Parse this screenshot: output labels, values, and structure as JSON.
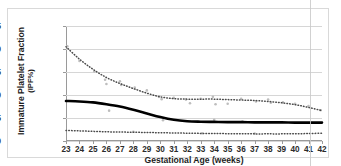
{
  "chart_data": {
    "type": "line",
    "title": "",
    "xlabel": "Gestational Age (weeks)",
    "ylabel": "Immature Platelet Fraction (IPF%)",
    "ylabel_line1": "Immature Platelet Fraction",
    "ylabel_line2": "(IPF%)",
    "xlim": [
      23,
      42
    ],
    "ylim": [
      0,
      25
    ],
    "yticks": [
      0,
      5,
      10,
      15,
      20,
      25
    ],
    "xticks": [
      23,
      24,
      25,
      26,
      27,
      28,
      29,
      30,
      31,
      32,
      33,
      34,
      35,
      36,
      37,
      38,
      39,
      40,
      41,
      42
    ],
    "grid": "horizontal",
    "legend": "none",
    "x": [
      23,
      24,
      25,
      26,
      27,
      28,
      29,
      30,
      31,
      32,
      33,
      34,
      35,
      36,
      37,
      38,
      39,
      40,
      41,
      42
    ],
    "series": [
      {
        "name": "95th percentile",
        "style": "dotted",
        "color": "#4a4a4a",
        "values": [
          20.5,
          17.8,
          15.6,
          13.8,
          12.5,
          11.4,
          10.4,
          9.6,
          9.2,
          9.1,
          9.1,
          9.1,
          9.0,
          8.9,
          8.8,
          8.6,
          8.3,
          7.9,
          7.3,
          6.6
        ]
      },
      {
        "name": "Median",
        "style": "solid",
        "color": "#000000",
        "values": [
          8.7,
          8.6,
          8.4,
          8.0,
          7.5,
          6.8,
          6.0,
          5.2,
          4.6,
          4.3,
          4.2,
          4.15,
          4.1,
          4.1,
          4.05,
          4.05,
          4.05,
          4.0,
          4.0,
          4.0
        ]
      },
      {
        "name": "5th percentile",
        "style": "dotted",
        "color": "#4a4a4a",
        "values": [
          2.3,
          2.2,
          2.1,
          2.0,
          1.95,
          1.9,
          1.85,
          1.8,
          1.75,
          1.7,
          1.65,
          1.62,
          1.6,
          1.58,
          1.55,
          1.55,
          1.55,
          1.58,
          1.62,
          1.7
        ]
      }
    ],
    "scatter_points": [
      {
        "x": 23.1,
        "y": 20.6
      },
      {
        "x": 24.0,
        "y": 17.4
      },
      {
        "x": 25.1,
        "y": 15.1
      },
      {
        "x": 25.9,
        "y": 13.3
      },
      {
        "x": 26.0,
        "y": 12.4
      },
      {
        "x": 26.2,
        "y": 6.6
      },
      {
        "x": 27.0,
        "y": 13.0
      },
      {
        "x": 27.1,
        "y": 12.2
      },
      {
        "x": 28.1,
        "y": 11.6
      },
      {
        "x": 29.0,
        "y": 11.0
      },
      {
        "x": 29.9,
        "y": 9.6
      },
      {
        "x": 30.1,
        "y": 9.1
      },
      {
        "x": 31.0,
        "y": 9.4
      },
      {
        "x": 31.9,
        "y": 9.0
      },
      {
        "x": 32.2,
        "y": 8.2
      },
      {
        "x": 33.0,
        "y": 9.2
      },
      {
        "x": 33.9,
        "y": 9.6
      },
      {
        "x": 34.1,
        "y": 8.0
      },
      {
        "x": 35.0,
        "y": 8.1
      },
      {
        "x": 36.0,
        "y": 9.2
      },
      {
        "x": 37.1,
        "y": 8.6
      },
      {
        "x": 38.0,
        "y": 9.0
      },
      {
        "x": 38.2,
        "y": 8.3
      },
      {
        "x": 39.1,
        "y": 8.4
      },
      {
        "x": 40.0,
        "y": 8.1
      },
      {
        "x": 41.0,
        "y": 7.6
      },
      {
        "x": 41.9,
        "y": 6.7
      },
      {
        "x": 34.0,
        "y": 4.6
      },
      {
        "x": 36.1,
        "y": 4.3
      },
      {
        "x": 30.2,
        "y": 4.5
      },
      {
        "x": 28.0,
        "y": 2.0
      },
      {
        "x": 33.1,
        "y": 1.7
      },
      {
        "x": 37.0,
        "y": 1.6
      }
    ]
  },
  "axes": {
    "y_tick_labels": [
      "0",
      "5",
      "10",
      "15",
      "20",
      "25"
    ],
    "x_tick_labels": [
      "23",
      "24",
      "25",
      "26",
      "27",
      "28",
      "29",
      "30",
      "31",
      "32",
      "33",
      "34",
      "35",
      "36",
      "37",
      "38",
      "39",
      "40",
      "41",
      "42"
    ]
  },
  "colors": {
    "grid": "#d6d6d6",
    "axis": "#9a9a9a",
    "median_line": "#000000",
    "percentile_line": "#4a4a4a",
    "scatter": "#bdbdbd",
    "frame": "#d9d9d9",
    "text": "#1d1d1d"
  }
}
